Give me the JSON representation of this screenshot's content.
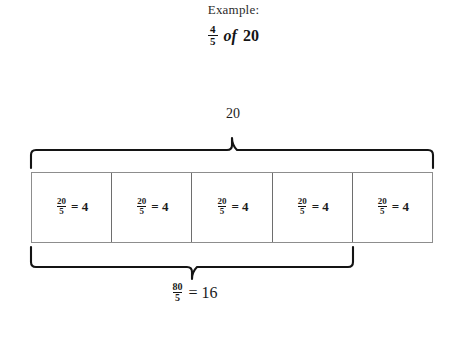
{
  "header": {
    "example_label": "Example:",
    "expression": {
      "fraction_numerator": "4",
      "fraction_denominator": "5",
      "operator": "of",
      "whole": "20"
    }
  },
  "diagram": {
    "top_measure": {
      "label": "20",
      "brace_icon": "top-curly-brace-icon"
    },
    "bar": {
      "cells": [
        {
          "numerator": "20",
          "denominator": "5",
          "equals": "= 4"
        },
        {
          "numerator": "20",
          "denominator": "5",
          "equals": "= 4"
        },
        {
          "numerator": "20",
          "denominator": "5",
          "equals": "= 4"
        },
        {
          "numerator": "20",
          "denominator": "5",
          "equals": "= 4"
        },
        {
          "numerator": "20",
          "denominator": "5",
          "equals": "= 4"
        }
      ]
    },
    "bottom_measure": {
      "brace_icon": "bottom-curly-brace-icon",
      "result": {
        "numerator": "80",
        "denominator": "5",
        "equals": "= 16"
      }
    }
  },
  "colors": {
    "background": "#ffffff",
    "ink": "#1a1a1a",
    "brace": "#141414",
    "bar_border": "#8d8d8d",
    "cell_divider": "#6e6e6e"
  }
}
